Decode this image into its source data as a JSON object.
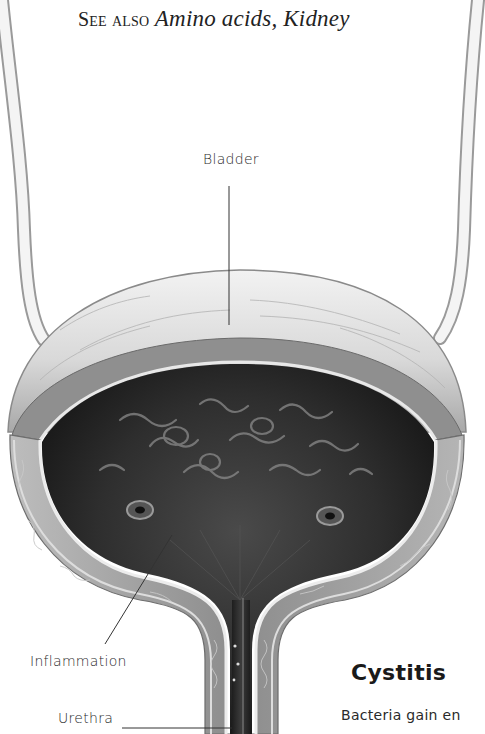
{
  "header": {
    "see_also_prefix": "See also",
    "see_also_refs": "Amino acids, Kidney"
  },
  "illustration": {
    "subject": "bladder-cross-section",
    "labels": {
      "bladder": "Bladder",
      "inflammation": "Inflammation",
      "urethra": "Urethra"
    },
    "colors": {
      "interior": "#2b2b2b",
      "wall": "#9a9a9a",
      "outer_surface": "#d8d8d8",
      "leader_line": "#333333"
    }
  },
  "article": {
    "title": "Cystitis",
    "body_start": "Bacteria gain en"
  }
}
